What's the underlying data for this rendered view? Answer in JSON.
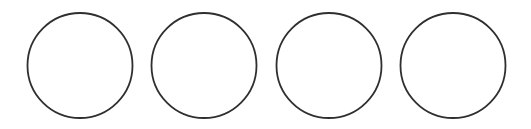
{
  "canvas": {
    "width": 531,
    "height": 129,
    "background": "#ffffff"
  },
  "style": {
    "stroke_color": "#2f2f2f",
    "stroke_width": 1.8,
    "fill": "#ffffff"
  },
  "shapes": [
    {
      "type": "circle",
      "cx": 80,
      "cy": 65.5,
      "r": 52.5
    },
    {
      "type": "circle",
      "cx": 204,
      "cy": 65.5,
      "r": 52.5
    },
    {
      "type": "circle",
      "cx": 329,
      "cy": 65.5,
      "r": 52.5
    },
    {
      "type": "circle",
      "cx": 453,
      "cy": 65.5,
      "r": 52.5
    }
  ]
}
